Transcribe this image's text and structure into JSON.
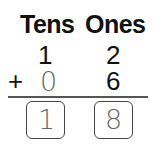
{
  "headers": {
    "tens": "Tens",
    "ones": "Ones"
  },
  "row1": {
    "tens": "1",
    "ones": "2"
  },
  "row2": {
    "operator": "+",
    "tens": "0",
    "ones": "6"
  },
  "answer": {
    "tens": "1",
    "ones": "8"
  }
}
